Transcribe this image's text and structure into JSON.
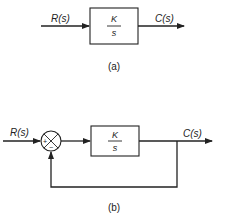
{
  "diagram_a": {
    "input_label": "R(s)",
    "output_label": "C(s)",
    "block": {
      "numerator": "K",
      "denominator": "s"
    },
    "caption": "(a)"
  },
  "diagram_b": {
    "input_label": "R(s)",
    "output_label": "C(s)",
    "summing_junction": {
      "plus": "+",
      "minus": "−"
    },
    "block": {
      "numerator": "K",
      "denominator": "s"
    },
    "caption": "(b)"
  },
  "colors": {
    "line": "#222222",
    "background": "#ffffff"
  }
}
